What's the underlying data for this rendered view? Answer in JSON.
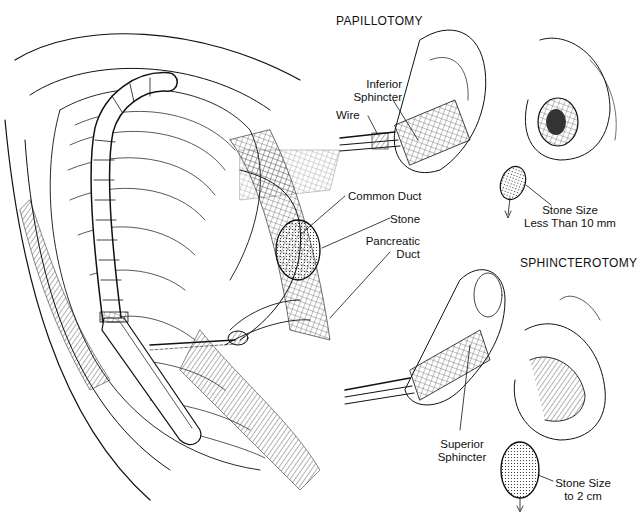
{
  "figure": {
    "ink_color": "#111111",
    "background": "#ffffff"
  },
  "main_view": {
    "labels": {
      "common_duct": "Common Duct",
      "stone": "Stone",
      "pancreatic_duct_line1": "Pancreatic",
      "pancreatic_duct_line2": "Duct"
    }
  },
  "papillotomy": {
    "title": "PAPILLOTOMY",
    "labels": {
      "inferior_sphincter_line1": "Inferior",
      "inferior_sphincter_line2": "Sphincter",
      "wire": "Wire"
    },
    "stone_note": {
      "line1": "Stone Size",
      "line2": "Less Than 10 mm"
    }
  },
  "sphincterotomy": {
    "title": "SPHINCTEROTOMY",
    "labels": {
      "superior_sphincter_line1": "Superior",
      "superior_sphincter_line2": "Sphincter"
    },
    "stone_note": {
      "line1": "Stone Size",
      "line2": "to 2 cm"
    }
  }
}
